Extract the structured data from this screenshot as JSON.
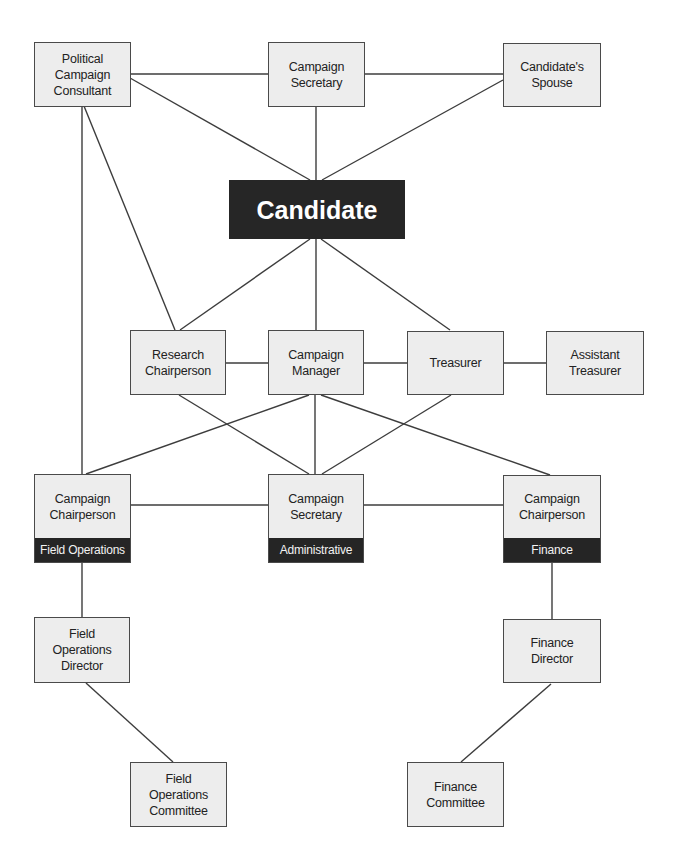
{
  "diagram": {
    "type": "organization-chart",
    "colors": {
      "box_fill": "#ededed",
      "box_border": "#4a4a4a",
      "band_fill": "#252525",
      "candidate_fill": "#262626",
      "line": "#3d3d3d"
    },
    "nodes": {
      "political_consultant": {
        "label": "Political\nCampaign\nConsultant"
      },
      "campaign_secretary_top": {
        "label": "Campaign\nSecretary"
      },
      "candidates_spouse": {
        "label": "Candidate's\nSpouse"
      },
      "candidate": {
        "label": "Candidate"
      },
      "research_chairperson": {
        "label": "Research\nChairperson"
      },
      "campaign_manager": {
        "label": "Campaign\nManager"
      },
      "treasurer": {
        "label": "Treasurer"
      },
      "assistant_treasurer": {
        "label": "Assistant\nTreasurer"
      },
      "chairperson_field_ops": {
        "label": "Campaign\nChairperson",
        "band": "Field Operations"
      },
      "secretary_administrative": {
        "label": "Campaign\nSecretary",
        "band": "Administrative"
      },
      "chairperson_finance": {
        "label": "Campaign\nChairperson",
        "band": "Finance"
      },
      "field_ops_director": {
        "label": "Field\nOperations\nDirector"
      },
      "finance_director": {
        "label": "Finance\nDirector"
      },
      "field_ops_committee": {
        "label": "Field\nOperations\nCommittee"
      },
      "finance_committee": {
        "label": "Finance\nCommittee"
      }
    },
    "edges": [
      [
        "political_consultant",
        "campaign_secretary_top"
      ],
      [
        "campaign_secretary_top",
        "candidates_spouse"
      ],
      [
        "political_consultant",
        "candidate"
      ],
      [
        "campaign_secretary_top",
        "candidate"
      ],
      [
        "candidates_spouse",
        "candidate"
      ],
      [
        "political_consultant",
        "research_chairperson"
      ],
      [
        "political_consultant",
        "chairperson_field_ops"
      ],
      [
        "candidate",
        "research_chairperson"
      ],
      [
        "candidate",
        "campaign_manager"
      ],
      [
        "candidate",
        "treasurer"
      ],
      [
        "research_chairperson",
        "campaign_manager"
      ],
      [
        "campaign_manager",
        "treasurer"
      ],
      [
        "treasurer",
        "assistant_treasurer"
      ],
      [
        "research_chairperson",
        "secretary_administrative"
      ],
      [
        "campaign_manager",
        "chairperson_field_ops"
      ],
      [
        "campaign_manager",
        "secretary_administrative"
      ],
      [
        "campaign_manager",
        "chairperson_finance"
      ],
      [
        "treasurer",
        "secretary_administrative"
      ],
      [
        "chairperson_field_ops",
        "secretary_administrative"
      ],
      [
        "secretary_administrative",
        "chairperson_finance"
      ],
      [
        "chairperson_field_ops",
        "field_ops_director"
      ],
      [
        "chairperson_finance",
        "finance_director"
      ],
      [
        "field_ops_director",
        "field_ops_committee"
      ],
      [
        "finance_director",
        "finance_committee"
      ]
    ]
  }
}
